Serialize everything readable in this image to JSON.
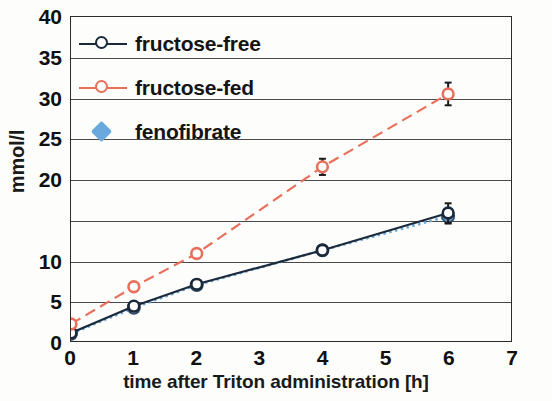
{
  "chart_data": {
    "type": "line",
    "title": "",
    "xlabel": "time after Triton administration [h]",
    "ylabel": "mmol/l",
    "xlim": [
      0,
      7
    ],
    "ylim": [
      0,
      40
    ],
    "xticks": [
      0,
      1,
      2,
      3,
      4,
      5,
      6,
      7
    ],
    "xtick_labels": [
      "0",
      "1",
      "2",
      "3",
      "4",
      "5",
      "6",
      "7"
    ],
    "yticks": [
      0,
      5,
      10,
      15,
      20,
      25,
      30,
      35,
      40
    ],
    "ytick_labels": [
      "0",
      "5",
      "10",
      "",
      "20",
      "25",
      "30",
      "35",
      "40"
    ],
    "grid": "horizontal",
    "legend_position": "top-left",
    "series": [
      {
        "name": "fructose-free",
        "color": "#1b2a3a",
        "marker": "open-circle",
        "linestyle": "solid",
        "x": [
          0,
          1,
          2,
          4,
          6
        ],
        "values": [
          1.0,
          4.3,
          7.0,
          11.2,
          15.8
        ],
        "errors": [
          0.4,
          0.4,
          0.4,
          0.6,
          1.2
        ]
      },
      {
        "name": "fructose-fed",
        "color": "#e8705a",
        "marker": "open-circle",
        "linestyle": "dashed",
        "x": [
          0,
          1,
          2,
          4,
          6
        ],
        "values": [
          2.1,
          6.7,
          10.8,
          21.5,
          30.5
        ],
        "errors": [
          0.3,
          0.4,
          0.4,
          1.0,
          1.4
        ]
      },
      {
        "name": "fenofibrate",
        "color": "#6aa9dd",
        "marker": "filled-diamond",
        "linestyle": "dotted",
        "x": [
          0,
          1,
          2,
          4,
          6
        ],
        "values": [
          0.9,
          4.1,
          6.9,
          11.2,
          15.4
        ],
        "errors": [
          0.3,
          0.3,
          0.3,
          0.5,
          0.9
        ]
      }
    ]
  },
  "legend": {
    "items": [
      {
        "label": "fructose-free",
        "marker": "open-circle",
        "color": "#1b2a3a"
      },
      {
        "label": "fructose-fed",
        "marker": "open-circle",
        "color": "#e8705a"
      },
      {
        "label": "fenofibrate",
        "marker": "filled-diamond",
        "color": "#6aa9dd"
      }
    ]
  }
}
